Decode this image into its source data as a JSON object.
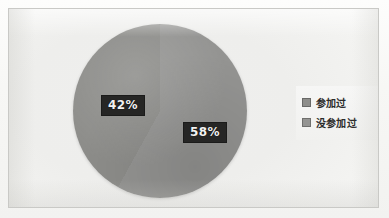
{
  "chart_data": {
    "type": "pie",
    "title": "",
    "categories": [
      "参加过",
      "没参加过"
    ],
    "values": [
      42,
      58
    ],
    "value_unit": "%",
    "data_labels": [
      "42%",
      "58%"
    ],
    "colors": [
      "#8d8d8a",
      "#949492"
    ],
    "legend": {
      "position": "right",
      "entries": [
        {
          "label": "参加过",
          "color": "#8d8d8a",
          "value": 42
        },
        {
          "label": "没参加过",
          "color": "#949492",
          "value": 58
        }
      ]
    },
    "grid": false,
    "xlabel": "",
    "ylabel": ""
  },
  "slices": {
    "left": {
      "label": "42%",
      "percent": 42,
      "color": "#8d8d8a"
    },
    "right": {
      "label": "58%",
      "percent": 58,
      "color": "#949492"
    }
  },
  "legend": {
    "items": [
      {
        "label": "参加过",
        "color": "#8d8d8a"
      },
      {
        "label": "没参加过",
        "color": "#949492"
      }
    ]
  },
  "colors": {
    "slice_a": "#8d8d8a",
    "slice_b": "#949492",
    "label_bg": "#262625",
    "label_text": "#f2f2f2",
    "frame_border": "#c9c9c6",
    "plot_bg": "#efefee"
  }
}
